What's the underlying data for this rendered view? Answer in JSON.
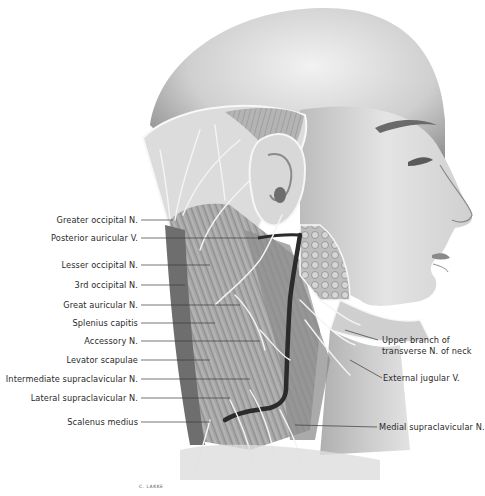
{
  "figure": {
    "credit": "C. LAKKE"
  },
  "labels_left": [
    {
      "text": "Greater occipital N.",
      "y": 220,
      "line_to_x": 173
    },
    {
      "text": "Posterior auricular V.",
      "y": 238,
      "line_to_x": 258
    },
    {
      "text": "Lesser occipital N.",
      "y": 265,
      "line_to_x": 210
    },
    {
      "text": "3rd occipital N.",
      "y": 285,
      "line_to_x": 185
    },
    {
      "text": "Great auricular N.",
      "y": 305,
      "line_to_x": 240
    },
    {
      "text": "Splenius capitis",
      "y": 323,
      "line_to_x": 215
    },
    {
      "text": "Accessory N.",
      "y": 341,
      "line_to_x": 260
    },
    {
      "text": "Levator scapulae",
      "y": 360,
      "line_to_x": 210
    },
    {
      "text": "Intermediate supraclavicular N.",
      "y": 379,
      "line_to_x": 250
    },
    {
      "text": "Lateral supraclavicular N.",
      "y": 398,
      "line_to_x": 230
    },
    {
      "text": "Scalenus medius",
      "y": 422,
      "line_to_x": 210
    }
  ],
  "labels_right": [
    {
      "text": "Upper branch of",
      "y": 340
    },
    {
      "text": "transverse N. of neck",
      "y": 351
    },
    {
      "text": "External jugular V.",
      "y": 378
    },
    {
      "text": "Medial supraclavicular N.",
      "y": 427
    }
  ],
  "colors": {
    "background": "#ffffff",
    "skin_light": "#e6e6e6",
    "skin_mid": "#bdbdbd",
    "skin_dark": "#8c8c8c",
    "muscle": "#9a9a9a",
    "vein": "#2b2b2b",
    "nerve": "#f4f4f4",
    "label_text": "#2a2a2a",
    "leader_line": "#3a3a3a"
  }
}
